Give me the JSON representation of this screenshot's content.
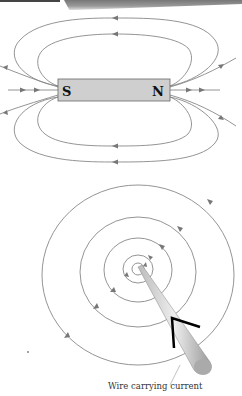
{
  "figure": {
    "bar_magnet": {
      "south_label": "S",
      "north_label": "N",
      "field_line_color": "#777777",
      "magnet_fill": "#cfcfcf"
    },
    "wire": {
      "caption": "Wire carrying current",
      "current_arrow_color": "#000000",
      "circle_count": 5
    }
  }
}
